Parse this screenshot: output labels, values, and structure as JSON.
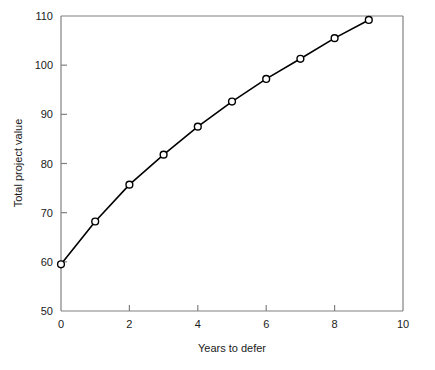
{
  "chart_data": {
    "type": "line",
    "title": "",
    "xlabel": "Years to defer",
    "ylabel": "Total project value",
    "x": [
      0,
      1,
      2,
      3,
      4,
      5,
      6,
      7,
      8,
      9
    ],
    "values": [
      59.5,
      68.2,
      75.7,
      81.8,
      87.5,
      92.6,
      97.2,
      101.3,
      105.5,
      109.2
    ],
    "series": [
      {
        "name": "Total project value",
        "values": [
          59.5,
          68.2,
          75.7,
          81.8,
          87.5,
          92.6,
          97.2,
          101.3,
          105.5,
          109.2
        ]
      }
    ],
    "xlim": [
      0,
      10
    ],
    "ylim": [
      50,
      110
    ],
    "xticks": [
      0,
      2,
      4,
      6,
      8,
      10
    ],
    "yticks": [
      50,
      60,
      70,
      80,
      90,
      100,
      110
    ],
    "xtick_labels": [
      "0",
      "2",
      "4",
      "6",
      "8",
      "10"
    ],
    "ytick_labels": [
      "50",
      "60",
      "70",
      "80",
      "90",
      "100",
      "110"
    ],
    "grid": false,
    "legend": false,
    "legend_position": "none",
    "marker": "open-circle",
    "line_color": "#000000",
    "marker_fill": "#ffffff",
    "axis_color": "#808080"
  }
}
